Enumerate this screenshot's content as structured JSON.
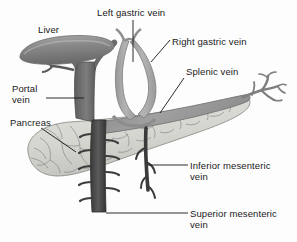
{
  "figure": {
    "background_color": "#fdfdfd",
    "text_color": "#1a1a1a"
  },
  "labels": [
    {
      "id": "liver",
      "text": "Liver",
      "x": 38,
      "y": 24,
      "lines": 1
    },
    {
      "id": "left_gastric_vein",
      "text": "Left gastric vein",
      "x": 97,
      "y": 7,
      "lines": 1
    },
    {
      "id": "right_gastric_vein",
      "text": "Right gastric vein",
      "x": 172,
      "y": 36,
      "lines": 1
    },
    {
      "id": "splenic_vein",
      "text": "Splenic vein",
      "x": 186,
      "y": 66,
      "lines": 1
    },
    {
      "id": "portal_vein_line1",
      "text": "Portal",
      "x": 12,
      "y": 83,
      "lines": 1
    },
    {
      "id": "portal_vein_line2",
      "text": "vein",
      "x": 12,
      "y": 94,
      "lines": 1
    },
    {
      "id": "pancreas",
      "text": "Pancreas",
      "x": 10,
      "y": 117,
      "lines": 1
    },
    {
      "id": "inferior_mes_line1",
      "text": "Inferior mesenteric",
      "x": 190,
      "y": 161,
      "lines": 1
    },
    {
      "id": "inferior_mes_line2",
      "text": "vein",
      "x": 190,
      "y": 172,
      "lines": 1
    },
    {
      "id": "superior_mes_line1",
      "text": "Superior mesenteric",
      "x": 190,
      "y": 209,
      "lines": 1
    },
    {
      "id": "superior_mes_line2",
      "text": "vein",
      "x": 190,
      "y": 220,
      "lines": 1
    }
  ],
  "structures": [
    {
      "id": "liver",
      "name": "Liver",
      "color": "#8c8c8c",
      "description": "Elongated dark grey lobe at upper left"
    },
    {
      "id": "portal_vein",
      "name": "Portal vein",
      "color": "#6e6e6e",
      "description": "Dark vertical trunk bifurcating into liver"
    },
    {
      "id": "pancreas",
      "name": "Pancreas",
      "color": "#d8d8d4",
      "description": "Light grey elongated organ with branching texture"
    },
    {
      "id": "splenic_vein",
      "name": "Splenic vein",
      "color": "#9b9b9b",
      "description": "Medium grey band along upper pancreatic tail"
    },
    {
      "id": "left_gastric_vein",
      "name": "Left gastric vein",
      "color": "#a6a6a6",
      "description": "Left limb of the gastric venous loop"
    },
    {
      "id": "right_gastric_vein",
      "name": "Right gastric vein",
      "color": "#a6a6a6",
      "description": "Right limb of the gastric venous loop"
    },
    {
      "id": "superior_mesenteric_vein",
      "name": "Superior mesenteric vein",
      "color": "#4a4a4a",
      "description": "Dark vertical trunk descending below pancreas with branch stubs"
    },
    {
      "id": "inferior_mesenteric_vein",
      "name": "Inferior mesenteric vein",
      "color": "#3f3f3f",
      "description": "Thin dark vessel descending from splenic vein"
    },
    {
      "id": "splenic_branches",
      "name": "Splenic hilar branches",
      "color": "#8f8f8f",
      "description": "Branching vessels at right tail end"
    }
  ],
  "leaders": [
    {
      "id": "leader-left-gastric",
      "from": [
        133,
        20
      ],
      "to": [
        133,
        62
      ],
      "kind": "vertical"
    },
    {
      "id": "leader-right-gastric",
      "from": [
        170,
        40
      ],
      "to": [
        151,
        62
      ],
      "kind": "diagonal"
    },
    {
      "id": "leader-splenic",
      "from": [
        184,
        78
      ],
      "to": [
        160,
        112
      ],
      "kind": "diagonal"
    },
    {
      "id": "leader-portal",
      "from": [
        45,
        98
      ],
      "to": [
        84,
        98
      ],
      "kind": "horizontal"
    },
    {
      "id": "leader-pancreas",
      "from": [
        40,
        128
      ],
      "to": [
        75,
        152
      ],
      "kind": "diagonal"
    },
    {
      "id": "leader-inferior-mes",
      "from": [
        188,
        165
      ],
      "to": [
        148,
        165
      ],
      "kind": "horizontal"
    },
    {
      "id": "leader-superior-mes",
      "from": [
        188,
        213
      ],
      "to": [
        106,
        213
      ],
      "kind": "horizontal"
    }
  ]
}
